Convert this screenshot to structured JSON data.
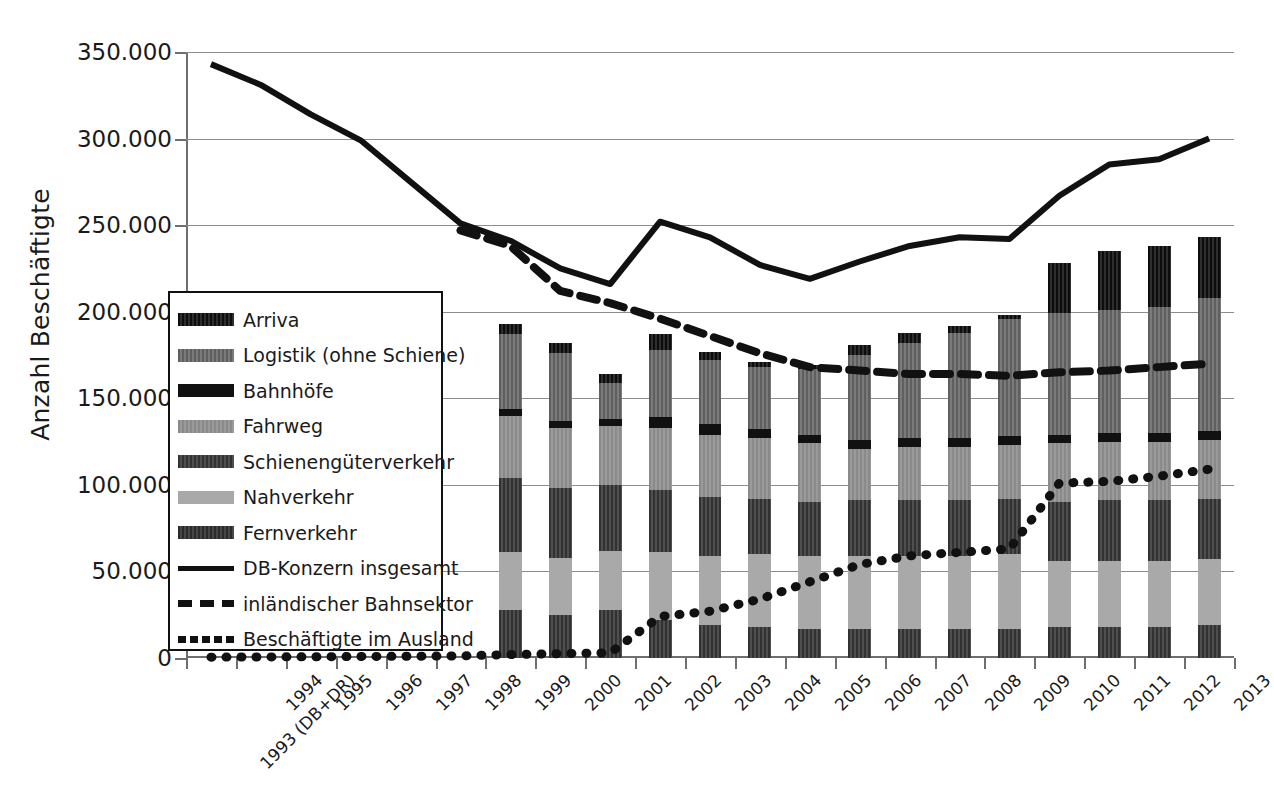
{
  "chart_data": {
    "type": "bar",
    "title": "",
    "xlabel": "",
    "ylabel": "Anzahl Beschäftigte",
    "ylim": [
      0,
      350000
    ],
    "ytick_labels": [
      "0",
      "50.000",
      "100.000",
      "150.000",
      "200.000",
      "250.000",
      "300.000",
      "350.000"
    ],
    "ytick_values": [
      0,
      50000,
      100000,
      150000,
      200000,
      250000,
      300000,
      350000
    ],
    "grid": true,
    "legend_position": "inside-left",
    "categories": [
      "1993 (DB+DR)",
      "1994",
      "1995",
      "1996",
      "1997",
      "1998",
      "1999",
      "2000",
      "2001",
      "2002",
      "2003",
      "2004",
      "2005",
      "2006",
      "2007",
      "2008",
      "2009",
      "2010",
      "2011",
      "2012",
      "2013"
    ],
    "stacked_series": [
      {
        "name": "Fernverkehr",
        "color": "#3b3b3b",
        "pattern": "dark-hatch",
        "values": [
          0,
          0,
          0,
          0,
          0,
          0,
          28000,
          25000,
          28000,
          22000,
          19000,
          18000,
          17000,
          17000,
          17000,
          17000,
          17000,
          18000,
          18000,
          18000,
          19000
        ]
      },
      {
        "name": "Nahverkehr",
        "color": "#a9a9a9",
        "pattern": "light",
        "values": [
          0,
          0,
          0,
          0,
          0,
          0,
          33000,
          33000,
          34000,
          39000,
          40000,
          42000,
          42000,
          42000,
          42000,
          42000,
          43000,
          38000,
          38000,
          38000,
          38000
        ]
      },
      {
        "name": "Schienengüterverkehr",
        "color": "#4a4a4a",
        "pattern": "dark-hatch",
        "values": [
          0,
          0,
          0,
          0,
          0,
          0,
          43000,
          40000,
          38000,
          36000,
          34000,
          32000,
          31000,
          32000,
          32000,
          32000,
          32000,
          34000,
          35000,
          35000,
          35000
        ]
      },
      {
        "name": "Fahrweg",
        "color": "#8f8f8f",
        "pattern": "mid",
        "values": [
          0,
          0,
          0,
          0,
          0,
          0,
          36000,
          35000,
          34000,
          36000,
          36000,
          35000,
          34000,
          30000,
          31000,
          31000,
          31000,
          34000,
          34000,
          34000,
          34000
        ]
      },
      {
        "name": "Bahnhöfe",
        "color": "#121212",
        "pattern": "black",
        "values": [
          0,
          0,
          0,
          0,
          0,
          0,
          4000,
          4000,
          4000,
          6000,
          6000,
          5000,
          5000,
          5000,
          5000,
          5000,
          5000,
          5000,
          5000,
          5000,
          5000
        ]
      },
      {
        "name": "Logistik (ohne Schiene)",
        "color": "#6a6a6a",
        "pattern": "mid-hatch",
        "values": [
          0,
          0,
          0,
          0,
          0,
          0,
          43000,
          39000,
          21000,
          39000,
          37000,
          36000,
          38000,
          49000,
          55000,
          61000,
          68000,
          70000,
          71000,
          73000,
          77000
        ]
      },
      {
        "name": "Arriva",
        "color": "#1c1c1c",
        "pattern": "black-hatch",
        "values": [
          0,
          0,
          0,
          0,
          0,
          0,
          6000,
          6000,
          5000,
          9000,
          5000,
          3000,
          2000,
          6000,
          6000,
          4000,
          2000,
          29000,
          34000,
          35000,
          35000
        ]
      }
    ],
    "bar_totals": [
      0,
      0,
      0,
      0,
      0,
      0,
      193000,
      182000,
      164000,
      187000,
      177000,
      171000,
      169000,
      181000,
      188000,
      192000,
      198000,
      228000,
      235000,
      238000,
      243000
    ],
    "line_series": [
      {
        "name": "DB-Konzern insgesamt",
        "style": "solid",
        "x": [
          "1993 (DB+DR)",
          "1994",
          "1995",
          "1996",
          "1997",
          "1998",
          "1999",
          "2000",
          "2001",
          "2002",
          "2003",
          "2004",
          "2005",
          "2006",
          "2007",
          "2008",
          "2009",
          "2010",
          "2011",
          "2012",
          "2013"
        ],
        "values": [
          343000,
          331000,
          314000,
          299000,
          275000,
          251000,
          241000,
          225000,
          216000,
          252000,
          243000,
          227000,
          219000,
          229000,
          238000,
          243000,
          242000,
          267000,
          285000,
          288000,
          300000
        ]
      },
      {
        "name": "inländischer Bahnsektor",
        "style": "dashed",
        "x": [
          "1998",
          "1999",
          "2000",
          "2001",
          "2002",
          "2003",
          "2004",
          "2005",
          "2006",
          "2007",
          "2008",
          "2009",
          "2010",
          "2011",
          "2012",
          "2013"
        ],
        "values": [
          247000,
          238000,
          212000,
          205000,
          196000,
          186000,
          176000,
          168000,
          166000,
          164000,
          164000,
          163000,
          165000,
          166000,
          168000,
          170000
        ]
      },
      {
        "name": "Beschäftigte im Ausland",
        "style": "dotted",
        "x": [
          "1993 (DB+DR)",
          "1994",
          "1995",
          "1996",
          "1997",
          "1998",
          "1999",
          "2000",
          "2001",
          "2002",
          "2003",
          "2004",
          "2005",
          "2006",
          "2007",
          "2008",
          "2009",
          "2010",
          "2011",
          "2012",
          "2013"
        ],
        "values": [
          500,
          600,
          700,
          900,
          1000,
          1200,
          2000,
          2500,
          3000,
          24000,
          27000,
          34000,
          44000,
          54000,
          59000,
          61000,
          63000,
          101000,
          102000,
          105000,
          109000
        ]
      }
    ]
  },
  "legend": {
    "items": [
      {
        "label": "Arriva",
        "kind": "swatch",
        "swatch": "black-hatch"
      },
      {
        "label": "Logistik (ohne Schiene)",
        "kind": "swatch",
        "swatch": "mid-hatch"
      },
      {
        "label": "Bahnhöfe",
        "kind": "swatch",
        "swatch": "black"
      },
      {
        "label": "Fahrweg",
        "kind": "swatch",
        "swatch": "mid"
      },
      {
        "label": "Schienengüterverkehr",
        "kind": "swatch",
        "swatch": "dark-hatch"
      },
      {
        "label": "Nahverkehr",
        "kind": "swatch",
        "swatch": "light"
      },
      {
        "label": "Fernverkehr",
        "kind": "swatch",
        "swatch": "dark-hatch2"
      },
      {
        "label": "DB-Konzern insgesamt",
        "kind": "line"
      },
      {
        "label": "inländischer Bahnsektor",
        "kind": "dashed"
      },
      {
        "label": "Beschäftigte im Ausland",
        "kind": "dotted"
      }
    ]
  },
  "colors": {
    "gridline": "#8c8c8c",
    "axis": "#6f6f6f",
    "text": "#1a1a1a",
    "line": "#111111"
  }
}
